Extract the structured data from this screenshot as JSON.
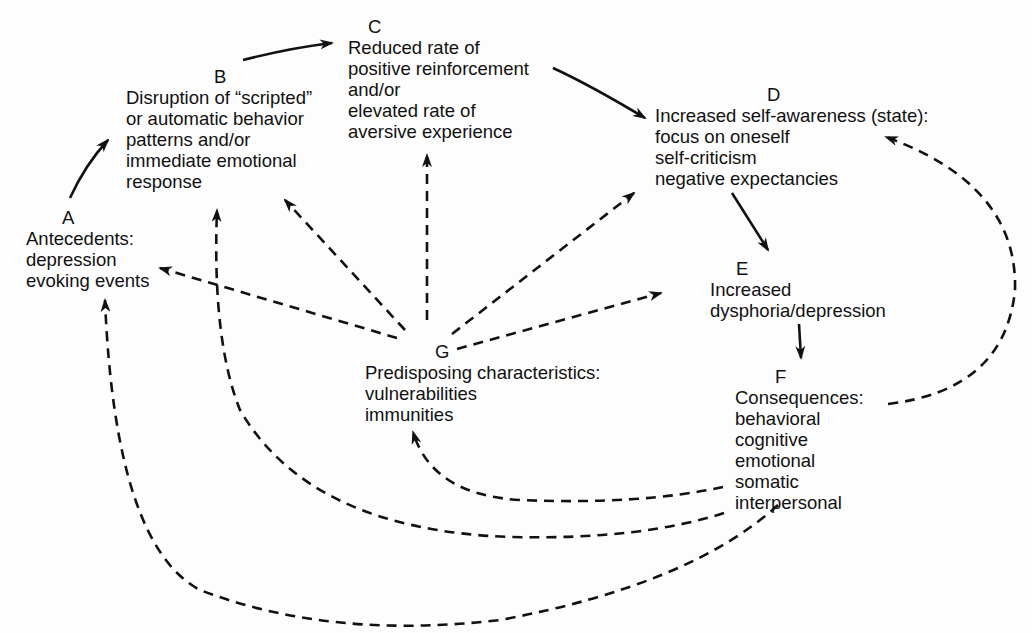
{
  "diagram": {
    "type": "flow-model",
    "colors": {
      "ink": "#111111",
      "background": "#fdfdfd"
    },
    "nodes": {
      "A": {
        "letter": "A",
        "lines": [
          "Antecedents:",
          "depression",
          "evoking events"
        ]
      },
      "B": {
        "letter": "B",
        "lines": [
          "Disruption of “scripted”",
          "or automatic behavior",
          "patterns and/or",
          "immediate emotional",
          "response"
        ]
      },
      "C": {
        "letter": "C",
        "lines": [
          "Reduced rate of",
          "positive reinforcement",
          "and/or",
          "elevated rate of",
          "aversive experience"
        ]
      },
      "D": {
        "letter": "D",
        "lines": [
          "Increased self-awareness (state):",
          "focus on oneself",
          "self-criticism",
          "negative expectancies"
        ]
      },
      "E": {
        "letter": "E",
        "lines": [
          "Increased",
          "dysphoria/depression"
        ]
      },
      "F": {
        "letter": "F",
        "lines": [
          "Consequences:",
          "behavioral",
          "cognitive",
          "emotional",
          "somatic",
          "interpersonal"
        ]
      },
      "G": {
        "letter": "G",
        "lines": [
          "Predisposing characteristics:",
          "vulnerabilities",
          "immunities"
        ]
      }
    },
    "edges": [
      {
        "from": "A",
        "to": "B",
        "style": "solid"
      },
      {
        "from": "B",
        "to": "C",
        "style": "solid"
      },
      {
        "from": "C",
        "to": "D",
        "style": "solid"
      },
      {
        "from": "D",
        "to": "E",
        "style": "solid"
      },
      {
        "from": "E",
        "to": "F",
        "style": "solid"
      },
      {
        "from": "G",
        "to": "A",
        "style": "dashed"
      },
      {
        "from": "G",
        "to": "B",
        "style": "dashed"
      },
      {
        "from": "G",
        "to": "C",
        "style": "dashed"
      },
      {
        "from": "G",
        "to": "D",
        "style": "dashed"
      },
      {
        "from": "G",
        "to": "E",
        "style": "dashed"
      },
      {
        "from": "F",
        "to": "D",
        "style": "dashed"
      },
      {
        "from": "F",
        "to": "G",
        "style": "dashed"
      },
      {
        "from": "F",
        "to": "B",
        "style": "dashed"
      },
      {
        "from": "F",
        "to": "A",
        "style": "dashed"
      }
    ]
  }
}
